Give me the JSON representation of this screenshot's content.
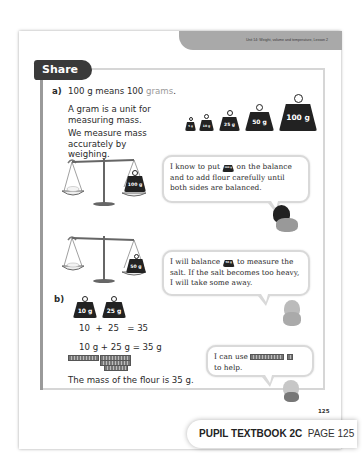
{
  "header": {
    "unit_label": "Unit 14: Weight, volume and temperature, Lesson 2"
  },
  "section": {
    "title": "Share"
  },
  "part_a": {
    "label": "a)",
    "line1_prefix": "100 g means 100 ",
    "line1_accent": "grams",
    "line1_suffix": ".",
    "line2": "A gram is a unit for measuring mass.",
    "line3": "We measure mass accurately by weighing.",
    "weights": [
      "5 g",
      "10 g",
      "25 g",
      "50 g",
      "100 g"
    ],
    "scale1_weight": "100 g",
    "scale2_weight": "50 g",
    "bubble1": {
      "before": "I know to put",
      "icon_weight": "100 g",
      "after": "on the balance and to add flour carefully until both sides are balanced."
    },
    "bubble2": {
      "before": "I will balance",
      "icon_weight": "50 g",
      "after": "to measure the salt. If the salt becomes too heavy, I will take some away."
    }
  },
  "part_b": {
    "label": "b)",
    "weights": [
      "10 g",
      "25 g"
    ],
    "equation1": "10  +  25   = 35",
    "equation2": "10 g + 25 g = 35 g",
    "conclusion": "The mass of the flour is 35 g.",
    "bubble3": {
      "before": "I can use",
      "after": "to help."
    }
  },
  "page_number": "125",
  "footer": {
    "book": "PUPIL TEXTBOOK 2C",
    "page": "PAGE 125"
  }
}
